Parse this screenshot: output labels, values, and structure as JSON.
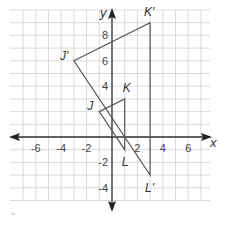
{
  "diagram": {
    "type": "coordinate-plane",
    "axes": {
      "x_label": "x",
      "y_label": "y",
      "x_ticks": [
        {
          "value": -6,
          "label": "-6"
        },
        {
          "value": -4,
          "label": "-4"
        },
        {
          "value": -2,
          "label": "-2"
        },
        {
          "value": 2,
          "label": "2"
        },
        {
          "value": 4,
          "label": "4"
        },
        {
          "value": 6,
          "label": "6"
        }
      ],
      "y_ticks": [
        {
          "value": 8,
          "label": "8"
        },
        {
          "value": 6,
          "label": "6"
        },
        {
          "value": 4,
          "label": "4"
        },
        {
          "value": -2,
          "label": "-2"
        },
        {
          "value": -4,
          "label": "-4"
        }
      ],
      "x_range": [
        -7.5,
        7.5
      ],
      "y_range": [
        -5,
        10
      ]
    },
    "triangles": [
      {
        "name": "JKL",
        "vertices": [
          {
            "label": "J",
            "x": -1,
            "y": 2
          },
          {
            "label": "K",
            "x": 1,
            "y": 3
          },
          {
            "label": "L",
            "x": 1,
            "y": -1
          }
        ]
      },
      {
        "name": "J'K'L'",
        "vertices": [
          {
            "label": "J'",
            "x": -3,
            "y": 6
          },
          {
            "label": "K'",
            "x": 3,
            "y": 9
          },
          {
            "label": "L'",
            "x": 3,
            "y": -3
          }
        ]
      }
    ]
  }
}
